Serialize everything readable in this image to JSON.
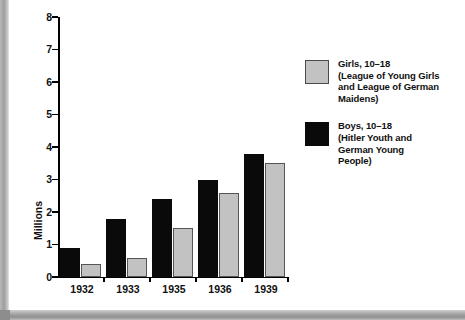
{
  "chart_data": {
    "type": "bar",
    "title": "",
    "xlabel": "",
    "ylabel": "Millions",
    "categories": [
      "1932",
      "1933",
      "1935",
      "1936",
      "1939"
    ],
    "ylim": [
      0,
      8
    ],
    "yticks": [
      "0",
      "1",
      "2",
      "3",
      "4",
      "5",
      "6",
      "7",
      "8"
    ],
    "grid": false,
    "legend_position": "right",
    "series": [
      {
        "name": "Boys, 10–18 (Hitler Youth and German Young People)",
        "color": "#0a0a0a",
        "values": [
          0.9,
          1.8,
          2.4,
          3.0,
          3.8
        ]
      },
      {
        "name": "Girls, 10–18 (League of Young Girls and League of German Maidens)",
        "color": "#c2c2c2",
        "values": [
          0.4,
          0.6,
          1.5,
          2.6,
          3.5
        ]
      }
    ]
  },
  "legend": {
    "items": [
      {
        "swatch": "gray",
        "lines": [
          "Girls, 10–18",
          "(League of Young Girls",
          "and League of German",
          "Maidens)"
        ]
      },
      {
        "swatch": "black",
        "lines": [
          "Boys, 10–18",
          "(Hitler Youth and",
          "German Young",
          "People)"
        ]
      }
    ]
  }
}
